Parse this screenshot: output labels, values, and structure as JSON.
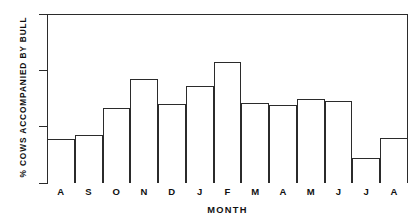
{
  "chart_data": {
    "type": "bar",
    "title": "",
    "xlabel": "MONTH",
    "ylabel": "% COWS ACCOMPANIED BY BULL",
    "categories": [
      "A",
      "S",
      "O",
      "N",
      "D",
      "J",
      "F",
      "M",
      "A",
      "M",
      "J",
      "J",
      "A"
    ],
    "values": [
      7.8,
      8.5,
      13.4,
      18.4,
      14.0,
      17.3,
      21.5,
      14.2,
      13.8,
      14.9,
      14.6,
      4.5,
      8.0
    ],
    "ylim": [
      0,
      30
    ],
    "yticks": [
      0,
      10,
      20,
      30
    ],
    "ytick_labels": [
      "0",
      "10",
      "20",
      "30"
    ],
    "grid": false,
    "legend": null,
    "bar_fill": "#ffffff",
    "bar_edge": "#2b2b2b",
    "background": "#ffffff"
  }
}
